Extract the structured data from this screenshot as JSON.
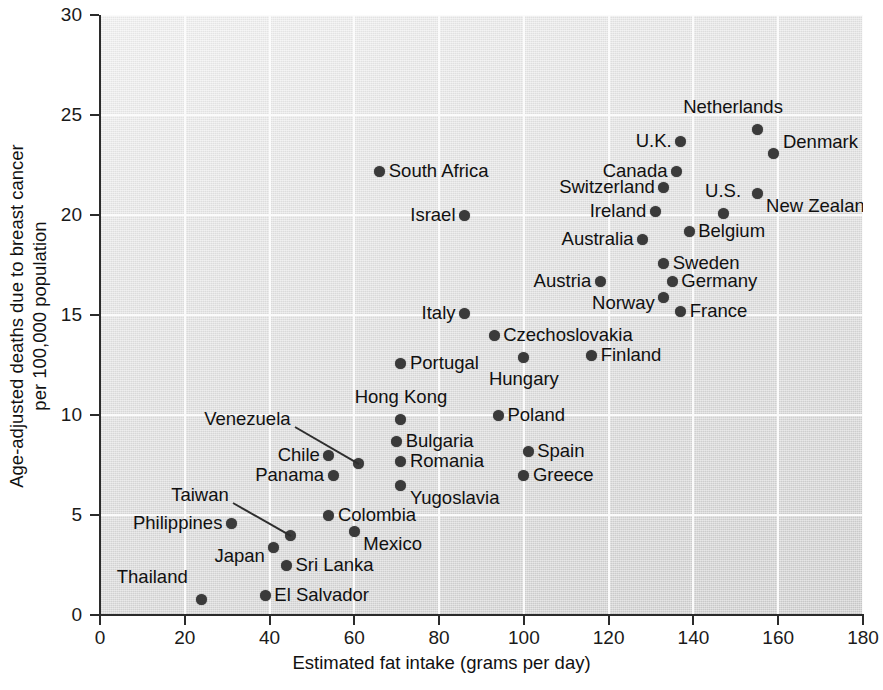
{
  "chart_data": {
    "type": "scatter",
    "title": "",
    "xlabel": "Estimated fat intake (grams per day)",
    "ylabel": "Age-adjusted deaths due to breast cancer\nper 100,000 population",
    "xlim": [
      0,
      180
    ],
    "ylim": [
      0,
      30
    ],
    "xticks": [
      0,
      20,
      40,
      60,
      80,
      100,
      120,
      140,
      160,
      180
    ],
    "yticks": [
      0,
      5,
      10,
      15,
      20,
      25,
      30
    ],
    "grid": true,
    "legend": "none",
    "point_color": "#3a3a3a",
    "plot_background": "#e2e2e2",
    "points": [
      {
        "name": "Thailand",
        "x": 24,
        "y": 0.8,
        "label_pos": "l",
        "label_dx": -14,
        "label_dy": -22
      },
      {
        "name": "El Salvador",
        "x": 39,
        "y": 1.0,
        "label_pos": "r",
        "label_dx": 9,
        "label_dy": 0
      },
      {
        "name": "Sri Lanka",
        "x": 44,
        "y": 2.5,
        "label_pos": "r",
        "label_dx": 9,
        "label_dy": 0
      },
      {
        "name": "Japan",
        "x": 41,
        "y": 3.4,
        "label_pos": "l",
        "label_dx": -9,
        "label_dy": 9
      },
      {
        "name": "Taiwan",
        "x": 45,
        "y": 4.0,
        "label_pos": "l",
        "label_dx": -62,
        "label_dy": -40,
        "leader": true
      },
      {
        "name": "Mexico",
        "x": 60,
        "y": 4.2,
        "label_pos": "r",
        "label_dx": 9,
        "label_dy": 13
      },
      {
        "name": "Philippines",
        "x": 31,
        "y": 4.6,
        "label_pos": "l",
        "label_dx": -9,
        "label_dy": 0
      },
      {
        "name": "Colombia",
        "x": 54,
        "y": 5.0,
        "label_pos": "r",
        "label_dx": 9,
        "label_dy": 0
      },
      {
        "name": "Yugoslavia",
        "x": 71,
        "y": 6.5,
        "label_pos": "r",
        "label_dx": 9,
        "label_dy": 13
      },
      {
        "name": "Panama",
        "x": 55,
        "y": 7.0,
        "label_pos": "l",
        "label_dx": -9,
        "label_dy": 0
      },
      {
        "name": "Greece",
        "x": 100,
        "y": 7.0,
        "label_pos": "r",
        "label_dx": 9,
        "label_dy": 0
      },
      {
        "name": "Romania",
        "x": 71,
        "y": 7.7,
        "label_pos": "r",
        "label_dx": 9,
        "label_dy": 0
      },
      {
        "name": "Venezuela",
        "x": 61,
        "y": 7.6,
        "label_pos": "l",
        "label_dx": -68,
        "label_dy": -44,
        "leader": true
      },
      {
        "name": "Chile",
        "x": 54,
        "y": 8.0,
        "label_pos": "l",
        "label_dx": -9,
        "label_dy": 0
      },
      {
        "name": "Spain",
        "x": 101,
        "y": 8.2,
        "label_pos": "r",
        "label_dx": 9,
        "label_dy": 0
      },
      {
        "name": "Bulgaria",
        "x": 70,
        "y": 8.7,
        "label_pos": "r",
        "label_dx": 9,
        "label_dy": 0
      },
      {
        "name": "Hong Kong",
        "x": 71,
        "y": 9.8,
        "label_pos": "c",
        "label_dx": 0,
        "label_dy": -22
      },
      {
        "name": "Poland",
        "x": 94,
        "y": 10.0,
        "label_pos": "r",
        "label_dx": 9,
        "label_dy": 0
      },
      {
        "name": "Portugal",
        "x": 71,
        "y": 12.6,
        "label_pos": "r",
        "label_dx": 9,
        "label_dy": 0
      },
      {
        "name": "Hungary",
        "x": 100,
        "y": 12.9,
        "label_pos": "c",
        "label_dx": 0,
        "label_dy": 22
      },
      {
        "name": "Finland",
        "x": 116,
        "y": 13.0,
        "label_pos": "r",
        "label_dx": 9,
        "label_dy": 0
      },
      {
        "name": "Czechoslovakia",
        "x": 93,
        "y": 14.0,
        "label_pos": "r",
        "label_dx": 9,
        "label_dy": 0
      },
      {
        "name": "Italy",
        "x": 86,
        "y": 15.1,
        "label_pos": "l",
        "label_dx": -9,
        "label_dy": 0
      },
      {
        "name": "France",
        "x": 137,
        "y": 15.2,
        "label_pos": "r",
        "label_dx": 9,
        "label_dy": 0
      },
      {
        "name": "Norway",
        "x": 133,
        "y": 15.9,
        "label_pos": "l",
        "label_dx": -9,
        "label_dy": 6
      },
      {
        "name": "Germany",
        "x": 135,
        "y": 16.7,
        "label_pos": "r",
        "label_dx": 9,
        "label_dy": 0
      },
      {
        "name": "Austria",
        "x": 118,
        "y": 16.7,
        "label_pos": "l",
        "label_dx": -9,
        "label_dy": 0
      },
      {
        "name": "Sweden",
        "x": 133,
        "y": 17.6,
        "label_pos": "r",
        "label_dx": 9,
        "label_dy": 0
      },
      {
        "name": "Australia",
        "x": 128,
        "y": 18.8,
        "label_pos": "l",
        "label_dx": -9,
        "label_dy": 0
      },
      {
        "name": "Belgium",
        "x": 139,
        "y": 19.2,
        "label_pos": "r",
        "label_dx": 9,
        "label_dy": 0
      },
      {
        "name": "Israel",
        "x": 86,
        "y": 20.0,
        "label_pos": "l",
        "label_dx": -9,
        "label_dy": 0
      },
      {
        "name": "Ireland",
        "x": 131,
        "y": 20.2,
        "label_pos": "l",
        "label_dx": -9,
        "label_dy": 0
      },
      {
        "name": "U.S.",
        "x": 147,
        "y": 20.1,
        "label_pos": "c",
        "label_dx": 0,
        "label_dy": -22
      },
      {
        "name": "Switzerland",
        "x": 133,
        "y": 21.4,
        "label_pos": "l",
        "label_dx": -9,
        "label_dy": 0
      },
      {
        "name": "New Zealand",
        "x": 155,
        "y": 21.1,
        "label_pos": "r",
        "label_dx": 9,
        "label_dy": 13
      },
      {
        "name": "South Africa",
        "x": 66,
        "y": 22.2,
        "label_pos": "r",
        "label_dx": 9,
        "label_dy": 0
      },
      {
        "name": "Canada",
        "x": 136,
        "y": 22.2,
        "label_pos": "l",
        "label_dx": -9,
        "label_dy": 0
      },
      {
        "name": "Denmark",
        "x": 159,
        "y": 23.1,
        "label_pos": "r",
        "label_dx": 9,
        "label_dy": -11
      },
      {
        "name": "U.K.",
        "x": 137,
        "y": 23.7,
        "label_pos": "l",
        "label_dx": -9,
        "label_dy": 0
      },
      {
        "name": "Netherlands",
        "x": 155,
        "y": 24.3,
        "label_pos": "c",
        "label_dx": -24,
        "label_dy": -22
      }
    ]
  }
}
